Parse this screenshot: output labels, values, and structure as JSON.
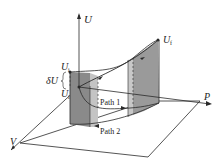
{
  "diagram": {
    "axes": {
      "u_label": "U",
      "p_label": "P",
      "v_label": "V"
    },
    "points": {
      "ui_label": "U",
      "ui_sub": "i",
      "uf_left_label": "U",
      "uf_left_sub": "i",
      "uf_right_label": "U",
      "uf_right_sub": "f"
    },
    "delta_label": "δU",
    "paths": [
      {
        "label": "Path 1"
      },
      {
        "label": "Path 2"
      }
    ],
    "colors": {
      "line": "#2a2a2a",
      "shade_dark": "#8a8a8a",
      "shade_light": "#c4c4c4",
      "plane": "#ffffff"
    }
  }
}
